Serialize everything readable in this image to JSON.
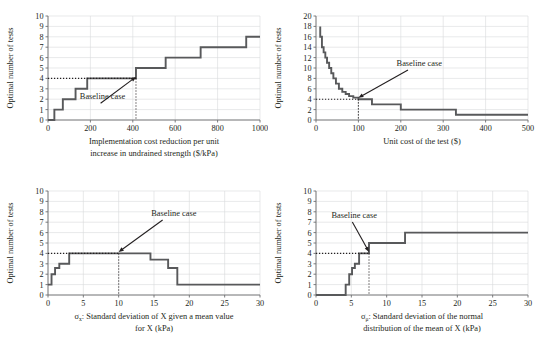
{
  "figure": {
    "line_color": "#58595b",
    "grid_color": "#d9dadb",
    "axis_color": "#6d6e71",
    "text_color": "#231f20",
    "annotation_label": "Baseline case"
  },
  "chart_data": [
    {
      "id": "panel-a",
      "type": "line",
      "title": "",
      "xlabel": "Implementation cost reduction per unit increase in undrained strength ($/kPa)",
      "xlabel_lines": [
        "Implementation cost reduction per unit",
        "increase in undrained strength ($/kPa)"
      ],
      "ylabel": "Optimal number of tests",
      "xlim": [
        0,
        1000
      ],
      "ylim": [
        0,
        10
      ],
      "xticks": [
        0,
        200,
        400,
        600,
        800,
        1000
      ],
      "yticks": [
        0,
        1,
        2,
        3,
        4,
        5,
        6,
        7,
        8,
        9,
        10
      ],
      "grid": true,
      "step_style": "post",
      "x": [
        0,
        30,
        30,
        70,
        70,
        130,
        130,
        185,
        185,
        290,
        290,
        415,
        415,
        555,
        555,
        720,
        720,
        935,
        935,
        1000
      ],
      "y": [
        0,
        0,
        1,
        1,
        2,
        2,
        3,
        3,
        4,
        4,
        4,
        4,
        5,
        5,
        6,
        6,
        7,
        7,
        8,
        8
      ],
      "baseline": {
        "x": 415,
        "y": 4,
        "label": "Baseline case"
      },
      "annotation_text_xy": [
        150,
        2.0
      ]
    },
    {
      "id": "panel-b",
      "type": "line",
      "title": "",
      "xlabel": "Unit cost of the test ($)",
      "xlabel_lines": [
        "Unit cost of the test ($)"
      ],
      "ylabel": "Optimal number of tests",
      "xlim": [
        0,
        500
      ],
      "ylim": [
        0,
        20
      ],
      "xticks": [
        0,
        100,
        200,
        300,
        400,
        500
      ],
      "yticks": [
        0,
        2,
        4,
        6,
        8,
        10,
        12,
        14,
        16,
        18,
        20
      ],
      "grid": true,
      "step_style": "post",
      "x": [
        10,
        10,
        14,
        14,
        18,
        18,
        22,
        22,
        26,
        26,
        31,
        31,
        36,
        36,
        41,
        41,
        47,
        47,
        54,
        54,
        62,
        62,
        70,
        70,
        78,
        78,
        88,
        88,
        100,
        100,
        132,
        132,
        200,
        200,
        330,
        330,
        500
      ],
      "y": [
        18,
        16,
        16,
        14,
        14,
        13,
        13,
        12,
        12,
        11,
        11,
        10,
        10,
        9,
        9,
        8,
        8,
        7,
        7,
        6,
        6,
        5.4,
        5.4,
        5,
        5,
        4.6,
        4.6,
        4.3,
        4.3,
        4,
        4,
        3,
        3,
        2,
        2,
        1,
        1
      ],
      "baseline": {
        "x": 100,
        "y": 4,
        "label": "Baseline case"
      },
      "annotation_text_xy": [
        190,
        10.4
      ]
    },
    {
      "id": "panel-c",
      "type": "line",
      "title": "",
      "xlabel": "σx: Standard deviation of X given a mean value for X (kPa)",
      "xlabel_lines": [
        ": Standard deviation of X given a mean value",
        "for X (kPa)"
      ],
      "xlabel_symbol": "σ",
      "xlabel_subscript": "x",
      "ylabel": "Optimal number of tests",
      "xlim": [
        0,
        30
      ],
      "ylim": [
        0,
        10
      ],
      "xticks": [
        0,
        5,
        10,
        15,
        20,
        25,
        30
      ],
      "yticks": [
        0,
        1,
        2,
        3,
        4,
        5,
        6,
        7,
        8,
        9,
        10
      ],
      "grid": true,
      "step_style": "post",
      "x": [
        0,
        0.5,
        0.5,
        1.0,
        1.0,
        1.6,
        1.6,
        3.0,
        3.0,
        14.5,
        14.5,
        17.0,
        17.0,
        18.3,
        18.3,
        30
      ],
      "y": [
        1,
        1,
        2,
        2,
        2.6,
        2.6,
        3,
        3,
        4,
        4,
        3.4,
        3.4,
        2.6,
        2.6,
        1,
        1,
        1
      ],
      "baseline": {
        "x": 10,
        "y": 4,
        "label": "Baseline case"
      },
      "annotation_text_xy": [
        14.6,
        7.6
      ]
    },
    {
      "id": "panel-d",
      "type": "line",
      "title": "",
      "xlabel": "σμ: Standard deviation of the normal distribution of the mean of X (kPa)",
      "xlabel_lines": [
        ": Standard deviation of the normal",
        "distribution of the mean of X (kPa)"
      ],
      "xlabel_symbol": "σ",
      "xlabel_subscript": "μ",
      "ylabel": "Optimal number of tests",
      "xlim": [
        0,
        30
      ],
      "ylim": [
        0,
        10
      ],
      "xticks": [
        0,
        5,
        10,
        15,
        20,
        25,
        30
      ],
      "yticks": [
        0,
        1,
        2,
        3,
        4,
        5,
        6,
        7,
        8,
        9,
        10
      ],
      "grid": true,
      "step_style": "post",
      "x": [
        0,
        4.2,
        4.2,
        4.7,
        4.7,
        5.1,
        5.1,
        5.5,
        5.5,
        6.1,
        6.1,
        7.5,
        7.5,
        12.6,
        12.6,
        30
      ],
      "y": [
        0,
        0,
        1,
        1,
        2,
        2,
        2.6,
        2.6,
        3,
        3,
        4,
        4,
        5,
        5,
        6,
        6
      ],
      "baseline": {
        "x": 7.5,
        "y": 4,
        "label": "Baseline case"
      },
      "annotation_text_xy": [
        2.2,
        7.4
      ]
    }
  ]
}
